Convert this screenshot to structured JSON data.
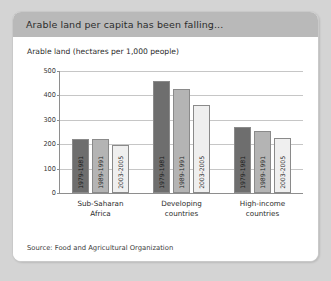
{
  "card": {
    "title": "Arable land per capita has been falling...",
    "axis_title": "Arable land (hectares per 1,000 people)",
    "source": "Source: Food and Agricultural Organization"
  },
  "colors": {
    "header_bg": "#b9b9b9",
    "page_bg": "#d4d4d4",
    "card_bg": "#ffffff",
    "bar_dark": "#6e6e6e",
    "bar_mid": "#b4b4b4",
    "bar_light": "#efefef",
    "axis": "#8e8e8e",
    "grid": "#c6c6c6"
  },
  "chart_data": {
    "type": "bar",
    "title": "Arable land per capita has been falling...",
    "subtitle": "Arable land (hectares per 1,000 people)",
    "xlabel": "",
    "ylabel": "Arable land (hectares per 1,000 people)",
    "ylim": [
      0,
      500
    ],
    "yticks": [
      0,
      100,
      200,
      300,
      400,
      500
    ],
    "ytick_labels": [
      "0",
      "100",
      "200",
      "300",
      "400",
      "500"
    ],
    "grid": true,
    "legend": "none",
    "categories": [
      "Sub-Saharan Africa",
      "Developing countries",
      "High-income countries"
    ],
    "periods": [
      "1979-1981",
      "1989-1991",
      "2003-2005"
    ],
    "series": [
      {
        "name": "1979-1981",
        "values": [
          220,
          460,
          270
        ]
      },
      {
        "name": "1989-1991",
        "values": [
          220,
          425,
          255
        ]
      },
      {
        "name": "2003-2005",
        "values": [
          198,
          360,
          225
        ]
      }
    ],
    "source": "Source: Food and Agricultural Organization"
  },
  "groups": [
    {
      "label_line1": "Sub-Saharan",
      "label_line2": "Africa",
      "bars": [
        {
          "period": "1979-1981",
          "value": 220,
          "shade": "dark"
        },
        {
          "period": "1989-1991",
          "value": 220,
          "shade": "mid"
        },
        {
          "period": "2003-2005",
          "value": 198,
          "shade": "light"
        }
      ]
    },
    {
      "label_line1": "Developing",
      "label_line2": "countries",
      "bars": [
        {
          "period": "1979-1981",
          "value": 460,
          "shade": "dark"
        },
        {
          "period": "1989-1991",
          "value": 425,
          "shade": "mid"
        },
        {
          "period": "2003-2005",
          "value": 360,
          "shade": "light"
        }
      ]
    },
    {
      "label_line1": "High-income",
      "label_line2": "countries",
      "bars": [
        {
          "period": "1979-1981",
          "value": 270,
          "shade": "dark"
        },
        {
          "period": "1989-1991",
          "value": 255,
          "shade": "mid"
        },
        {
          "period": "2003-2005",
          "value": 225,
          "shade": "light"
        }
      ]
    }
  ]
}
